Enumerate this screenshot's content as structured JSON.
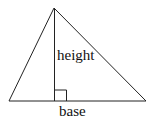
{
  "diagram": {
    "type": "triangle-area",
    "labels": {
      "height": "height",
      "base": "base"
    },
    "colors": {
      "stroke": "#222222",
      "background": "#ffffff",
      "text": "#111111"
    }
  }
}
